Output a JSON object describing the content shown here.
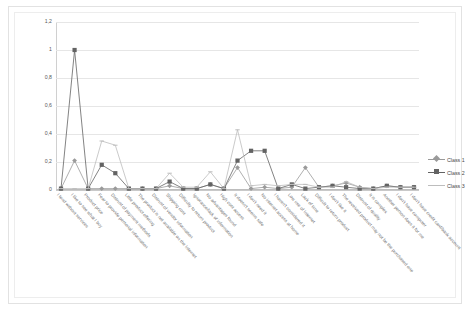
{
  "chart_data": {
    "type": "line",
    "title": "",
    "xlabel": "",
    "ylabel": "",
    "ylim": [
      0,
      1.2
    ],
    "yticks": [
      "0",
      "0,2",
      "0,4",
      "0,6",
      "0,8",
      "1",
      "1,2"
    ],
    "ytick_values": [
      0,
      0.2,
      0.4,
      0.6,
      0.8,
      1.0,
      1.2
    ],
    "grid": true,
    "legend_position": "right",
    "colors": {
      "class1": "#9a9a9a",
      "class2": "#636363",
      "class3": "#bdbdbd",
      "grid": "#e6e6e6",
      "axis": "#c9c9c9",
      "text": "#6b6b6b"
    },
    "categories": [
      "I tend without services",
      "I like to see what I buy",
      "Product price",
      "Fear to provide personal information",
      "Distrust of payment methods",
      "Little product offering",
      "The product is not available on the Internet",
      "Distrust of vendor information",
      "Shipping cost",
      "Difficulty to return product",
      "Ignorance/lack of information",
      "No advantages found",
      "High cost access",
      "It doesn't seems safe",
      "I don't need it",
      "No internet access at home",
      "I haven't considered it",
      "Low use of Internet",
      "Lack of time",
      "Difficult to return product",
      "I don't like it",
      "The received product may not be the purchased one",
      "Distrust of quality",
      "It is complex",
      "Another person does it for me",
      "I don't have computer",
      "I don't have credit card/bank account"
    ],
    "series": [
      {
        "name": "Class 1",
        "marker": "diamond",
        "values": [
          0.01,
          0.21,
          0.01,
          0.01,
          0.01,
          0.01,
          0.01,
          0.01,
          0.03,
          0.01,
          0.01,
          0.04,
          0.01,
          0.16,
          0.01,
          0.02,
          0.01,
          0.02,
          0.16,
          0.02,
          0.03,
          0.05,
          0.02,
          0.01,
          0.03,
          0.02,
          0.02
        ]
      },
      {
        "name": "Class 2",
        "marker": "square",
        "values": [
          0.01,
          1.0,
          0.01,
          0.18,
          0.12,
          0.01,
          0.01,
          0.01,
          0.06,
          0.01,
          0.01,
          0.04,
          0.01,
          0.21,
          0.28,
          0.28,
          0.01,
          0.04,
          0.01,
          0.02,
          0.03,
          0.02,
          0.01,
          0.01,
          0.03,
          0.02,
          0.02
        ]
      },
      {
        "name": "Class 3",
        "marker": "line",
        "values": [
          0.01,
          0.01,
          0.01,
          0.35,
          0.32,
          0.01,
          0.01,
          0.01,
          0.12,
          0.02,
          0.02,
          0.13,
          0.01,
          0.43,
          0.03,
          0.04,
          0.03,
          0.04,
          0.04,
          0.02,
          0.02,
          0.06,
          0.02,
          0.01,
          0.02,
          0.02,
          0.02
        ]
      }
    ]
  },
  "legend": {
    "items": [
      {
        "label": "Class 1"
      },
      {
        "label": "Class 2"
      },
      {
        "label": "Class 3"
      }
    ]
  }
}
